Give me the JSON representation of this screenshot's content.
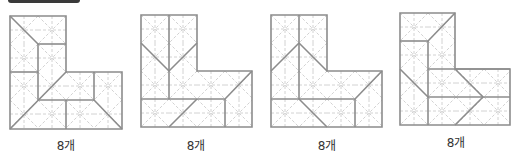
{
  "header": {
    "bar_color": "#3a3a3a"
  },
  "colors": {
    "solid": "#8c8c8c",
    "dashed": "#d2d2d2"
  },
  "cell_size": 28,
  "figures": [
    {
      "id": "figure-1",
      "label": "8개",
      "label_pos": [
        66,
        144
      ],
      "origin": [
        10,
        16
      ],
      "outline": [
        [
          10,
          16
        ],
        [
          66,
          16
        ],
        [
          66,
          72
        ],
        [
          122,
          72
        ],
        [
          122,
          129
        ],
        [
          10,
          129
        ]
      ],
      "solid_lines": [
        [
          10,
          16,
          38,
          44
        ],
        [
          38,
          44,
          66,
          44
        ],
        [
          38,
          44,
          38,
          100
        ],
        [
          10,
          72,
          38,
          72
        ],
        [
          10,
          129,
          66,
          72
        ],
        [
          38,
          100,
          94,
          100
        ],
        [
          66,
          100,
          66,
          129
        ],
        [
          94,
          72,
          94,
          100
        ],
        [
          94,
          100,
          122,
          129
        ]
      ]
    },
    {
      "id": "figure-2",
      "label": "8개",
      "label_pos": [
        196,
        144
      ],
      "origin": [
        141,
        15
      ],
      "outline": [
        [
          141,
          15
        ],
        [
          197,
          15
        ],
        [
          197,
          71
        ],
        [
          252,
          71
        ],
        [
          252,
          127
        ],
        [
          141,
          127
        ]
      ],
      "solid_lines": [
        [
          169,
          15,
          169,
          99
        ],
        [
          141,
          43,
          169,
          71
        ],
        [
          197,
          43,
          169,
          71
        ],
        [
          141,
          99,
          225,
          99
        ],
        [
          169,
          127,
          197,
          99
        ],
        [
          225,
          99,
          225,
          127
        ],
        [
          225,
          99,
          252,
          71
        ]
      ]
    },
    {
      "id": "figure-3",
      "label": "8개",
      "label_pos": [
        327,
        144
      ],
      "origin": [
        271,
        15
      ],
      "outline": [
        [
          271,
          15
        ],
        [
          327,
          15
        ],
        [
          327,
          71
        ],
        [
          382,
          71
        ],
        [
          382,
          127
        ],
        [
          271,
          127
        ]
      ],
      "solid_lines": [
        [
          299,
          15,
          299,
          99
        ],
        [
          271,
          71,
          299,
          43
        ],
        [
          299,
          43,
          327,
          71
        ],
        [
          271,
          99,
          355,
          99
        ],
        [
          299,
          99,
          327,
          127
        ],
        [
          355,
          99,
          355,
          127
        ],
        [
          355,
          99,
          382,
          71
        ]
      ]
    },
    {
      "id": "figure-4",
      "label": "8개",
      "label_pos": [
        456,
        141
      ],
      "origin": [
        400,
        13
      ],
      "outline": [
        [
          400,
          13
        ],
        [
          455,
          13
        ],
        [
          455,
          69
        ],
        [
          510,
          69
        ],
        [
          510,
          125
        ],
        [
          400,
          125
        ]
      ],
      "solid_lines": [
        [
          400,
          41,
          428,
          41
        ],
        [
          428,
          41,
          455,
          13
        ],
        [
          428,
          41,
          428,
          125
        ],
        [
          428,
          69,
          510,
          69
        ],
        [
          400,
          69,
          428,
          97
        ],
        [
          428,
          97,
          510,
          97
        ],
        [
          455,
          69,
          483,
          97
        ],
        [
          483,
          97,
          455,
          125
        ]
      ]
    }
  ]
}
